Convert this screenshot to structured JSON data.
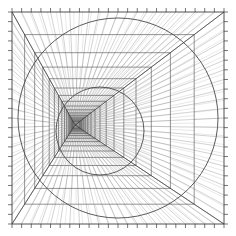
{
  "figure": {
    "width": 236,
    "height": 236,
    "background_color": "#ffffff",
    "line_color": "#5a5a5a",
    "line_color_dark": "#3c3c3c",
    "line_color_light": "#9a9a9a",
    "circle_color": "#4a4a4a"
  },
  "chart_data": {
    "type": "line",
    "title": "Perspective tunnel of nested squares and circles",
    "xlabel": "",
    "ylabel": "",
    "xlim": [
      0,
      236
    ],
    "ylim": [
      0,
      236
    ],
    "grid": false,
    "legend": "none",
    "frame": {
      "name": "outer-square",
      "left": 12,
      "top": 12,
      "right": 224,
      "bottom": 224,
      "tick_count_per_side": 22,
      "tick_length": 4
    },
    "vanishing_point": {
      "x": 75,
      "y": 125
    },
    "square_series": {
      "name": "nested-squares",
      "count": 17,
      "shrink_ratio": 0.8,
      "description": "each successive square is interpolated toward the vanishing point by the shrink ratio",
      "squares": [
        {
          "i": 0,
          "left": 12.0,
          "top": 12.0,
          "right": 224.0,
          "bottom": 224.0
        },
        {
          "i": 1,
          "left": 24.6,
          "top": 34.6,
          "right": 194.2,
          "bottom": 204.2
        },
        {
          "i": 2,
          "left": 34.7,
          "top": 52.7,
          "right": 170.4,
          "bottom": 188.4
        },
        {
          "i": 3,
          "left": 42.8,
          "top": 67.1,
          "right": 151.3,
          "bottom": 175.7
        },
        {
          "i": 4,
          "left": 49.2,
          "top": 78.7,
          "right": 136.0,
          "bottom": 165.5
        },
        {
          "i": 5,
          "left": 54.4,
          "top": 88.0,
          "right": 123.8,
          "bottom": 157.4
        },
        {
          "i": 6,
          "left": 58.5,
          "top": 95.4,
          "right": 114.0,
          "bottom": 151.0
        },
        {
          "i": 7,
          "left": 61.8,
          "top": 101.3,
          "right": 106.2,
          "bottom": 145.8
        },
        {
          "i": 8,
          "left": 64.5,
          "top": 106.0,
          "right": 100.0,
          "bottom": 141.6
        },
        {
          "i": 9,
          "left": 66.6,
          "top": 109.8,
          "right": 95.0,
          "bottom": 138.3
        },
        {
          "i": 10,
          "left": 68.3,
          "top": 112.9,
          "right": 91.0,
          "bottom": 135.6
        },
        {
          "i": 11,
          "left": 69.6,
          "top": 115.3,
          "right": 87.8,
          "bottom": 133.5
        },
        {
          "i": 12,
          "left": 70.7,
          "top": 117.2,
          "right": 85.2,
          "bottom": 131.8
        },
        {
          "i": 13,
          "left": 71.6,
          "top": 118.8,
          "right": 83.2,
          "bottom": 130.4
        },
        {
          "i": 14,
          "left": 72.3,
          "top": 120.0,
          "right": 81.6,
          "bottom": 129.3
        },
        {
          "i": 15,
          "left": 72.8,
          "top": 121.0,
          "right": 80.3,
          "bottom": 128.5
        },
        {
          "i": 16,
          "left": 73.2,
          "top": 121.8,
          "right": 79.2,
          "bottom": 127.8
        }
      ]
    },
    "radial_lines": {
      "name": "perspective-rays",
      "count_per_edge": 22,
      "origin": "vanishing_point",
      "description": "rays from the vanishing point to evenly spaced points along the outer square perimeter"
    },
    "diagonals": {
      "name": "corner-diagonals",
      "count": 4,
      "description": "rays from the vanishing point to each of the four outer corners"
    },
    "circles": [
      {
        "name": "outer-circle",
        "cx": 118,
        "cy": 118,
        "r": 100,
        "stroke": "#4a4a4a",
        "stroke_width": 0.9
      },
      {
        "name": "inner-circle",
        "cx": 100,
        "cy": 131,
        "r": 44,
        "stroke": "#4a4a4a",
        "stroke_width": 0.9
      }
    ],
    "cross_hatching": {
      "name": "wall-hatching",
      "description": "dense quadrilateral hatching between consecutive nested squares on the left, top, right and bottom faces creating the tunnel wall texture"
    }
  }
}
